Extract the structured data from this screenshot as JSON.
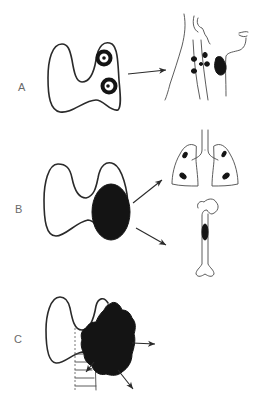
{
  "figure": {
    "panels": [
      {
        "label": "A",
        "description": "Thyroid with two ring-shaped nodules in the right lobe, spreading to cervical lymph nodes in the neck",
        "source": "thyroid-with-nodules",
        "targets": [
          "neck-lymph-nodes"
        ]
      },
      {
        "label": "B",
        "description": "Thyroid with large solid tumor in the right lobe, spreading to lungs and bone",
        "source": "thyroid-with-solid-mass",
        "targets": [
          "lungs",
          "femur"
        ]
      },
      {
        "label": "C",
        "description": "Thyroid with irregular invasive mass extending beyond the gland toward the trachea and surrounding tissue",
        "source": "thyroid-with-invasive-mass",
        "targets": [
          "local-invasion"
        ]
      }
    ],
    "colors": {
      "ink": "#2a2a2a",
      "fill": "#141414",
      "label": "#6a6a6a",
      "background": "#ffffff"
    }
  }
}
